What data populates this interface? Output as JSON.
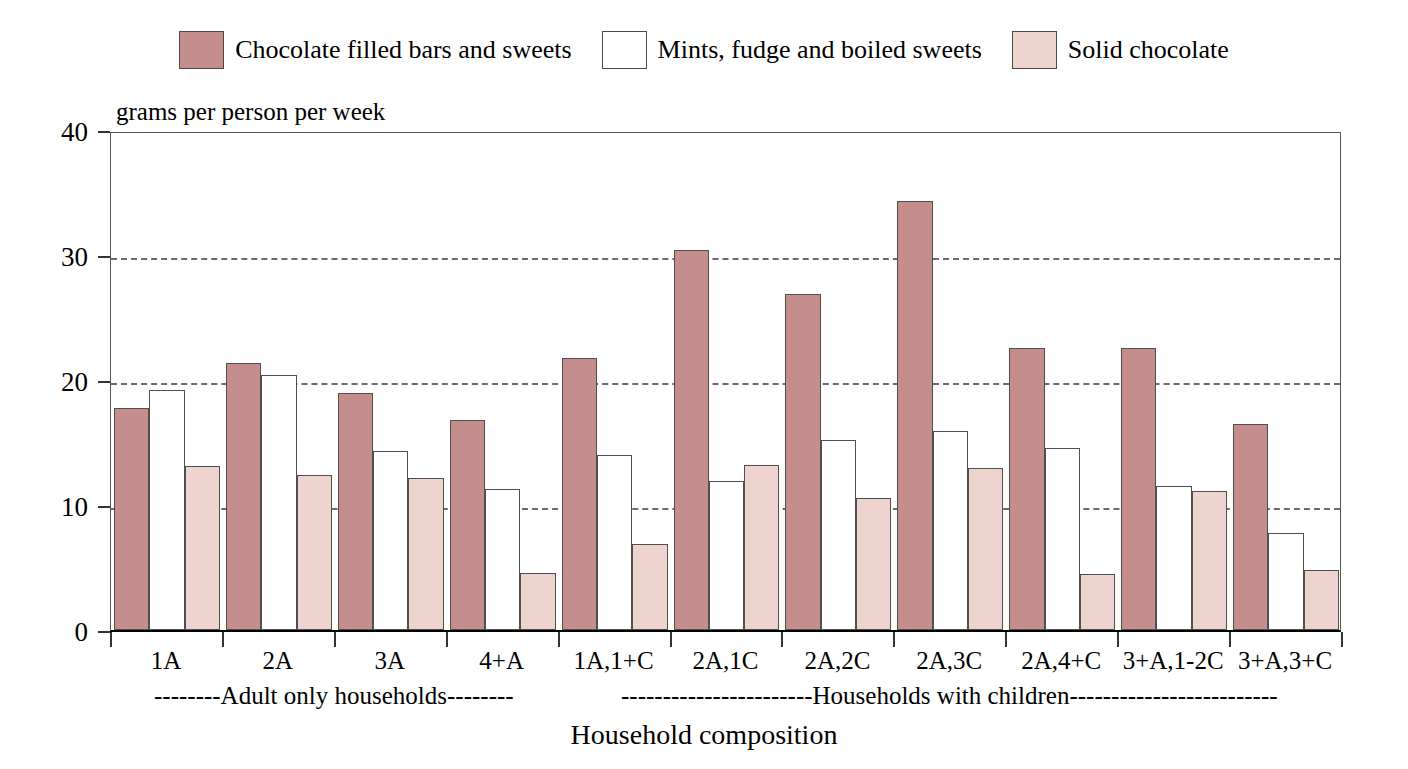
{
  "chart_data": {
    "type": "bar",
    "title": "",
    "xlabel": "Household composition",
    "ylabel": "grams per person per week",
    "ylim": [
      0,
      40
    ],
    "yticks": [
      0,
      10,
      20,
      30,
      40
    ],
    "ytick_labels": [
      "0",
      "10",
      "20",
      "30",
      "40"
    ],
    "grid": "horizontal dotted at 10, 20, 30",
    "legend_position": "top-center",
    "categories": [
      "1A",
      "2A",
      "3A",
      "4+A",
      "1A,1+C",
      "2A,1C",
      "2A,2C",
      "2A,3C",
      "2A,4+C",
      "3+A,1-2C",
      "3+A,3+C"
    ],
    "series": [
      {
        "name": "Chocolate filled bars and sweets",
        "color": "#c68d8d",
        "values": [
          17.8,
          21.4,
          19.0,
          16.8,
          21.8,
          30.4,
          26.9,
          34.3,
          22.6,
          22.6,
          16.5
        ]
      },
      {
        "name": "Mints, fudge and boiled sweets",
        "color": "#ffffff",
        "values": [
          19.2,
          20.4,
          14.3,
          11.3,
          14.0,
          11.9,
          15.2,
          15.9,
          14.6,
          11.5,
          7.8
        ]
      },
      {
        "name": "Solid chocolate",
        "color": "#eed3cf",
        "values": [
          13.1,
          12.4,
          12.2,
          4.6,
          6.9,
          13.2,
          10.6,
          13.0,
          4.5,
          11.1,
          4.8
        ]
      }
    ],
    "group_brackets": [
      {
        "label": "--------Adult only households--------",
        "span_categories": [
          "1A",
          "2A",
          "3A",
          "4+A"
        ]
      },
      {
        "label": "-----------------------Households with children-------------------------",
        "span_categories": [
          "1A,1+C",
          "2A,1C",
          "2A,2C",
          "2A,3C",
          "2A,4+C",
          "3+A,1-2C",
          "3+A,3+C"
        ]
      }
    ]
  },
  "legend": {
    "items": [
      {
        "label": "Chocolate filled bars and sweets",
        "color": "#c68d8d"
      },
      {
        "label": "Mints, fudge and boiled sweets",
        "color": "#ffffff"
      },
      {
        "label": "Solid chocolate",
        "color": "#eed3cf"
      }
    ]
  },
  "axis": {
    "y_title": "grams per person per week",
    "x_title": "Household composition"
  }
}
